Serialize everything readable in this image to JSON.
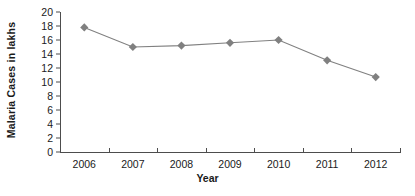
{
  "chart_data": {
    "type": "line",
    "title": "",
    "xlabel": "Year",
    "ylabel": "Malaria Cases in lakhs",
    "categories": [
      "2006",
      "2007",
      "2008",
      "2009",
      "2010",
      "2011",
      "2012"
    ],
    "values": [
      17.8,
      15.0,
      15.2,
      15.6,
      16.0,
      13.1,
      10.7
    ],
    "series": [
      {
        "name": "Malaria Cases in lakhs",
        "values": [
          17.8,
          15.0,
          15.2,
          15.6,
          16.0,
          13.1,
          10.7
        ]
      }
    ],
    "ylim": [
      0,
      20
    ],
    "ytick_labels": [
      "0",
      "2",
      "4",
      "6",
      "8",
      "10",
      "12",
      "14",
      "16",
      "18",
      "20"
    ],
    "ytick_values": [
      0,
      2,
      4,
      6,
      8,
      10,
      12,
      14,
      16,
      18,
      20
    ],
    "grid": false,
    "legend": false,
    "legend_position": "none",
    "marker": "diamond",
    "series_color": "#808080",
    "axis_color": "#4d4d4d",
    "text_color": "#1a1a1a",
    "background_color": "#ffffff"
  }
}
